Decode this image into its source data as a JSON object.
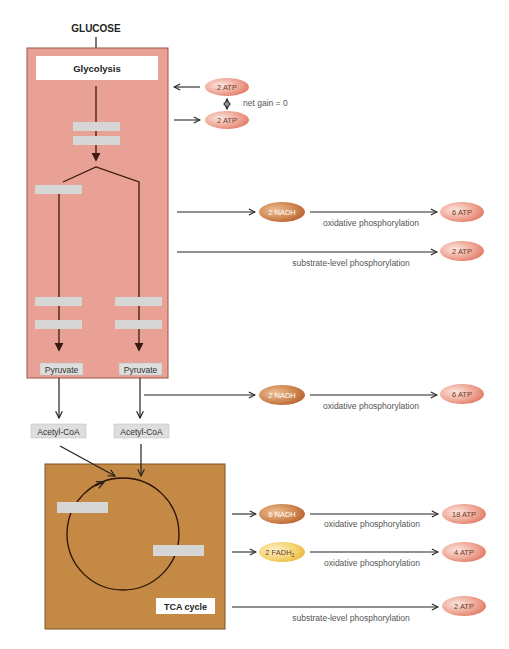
{
  "diagram": {
    "title": "GLUCOSE",
    "glycolysis_label": "Glycolysis",
    "tca_label": "TCA cycle",
    "pyruvate_left": "Pyruvate",
    "pyruvate_right": "Pyruvate",
    "acetyl_left": "Acetyl-CoA",
    "acetyl_right": "Acetyl-CoA",
    "net_gain": "net gain = 0",
    "nodes": {
      "atp_in": "2 ATP",
      "atp_out": "2 ATP",
      "nadh_glycolysis": "2 NADH",
      "atp_from_nadh_glycolysis": "6 ATP",
      "atp_substrate_glycolysis": "2 ATP",
      "nadh_pyruvate": "2 NADH",
      "atp_from_nadh_pyruvate": "6 ATP",
      "nadh_tca": "6 NADH",
      "atp_from_nadh_tca": "18 ATP",
      "fadh2_tca": "2 FADH",
      "fadh2_sub": "2",
      "atp_from_fadh2_tca": "4 ATP",
      "atp_substrate_tca": "2 ATP"
    },
    "process_labels": {
      "oxphos_1": "oxidative phosphorylation",
      "substrate_1": "substrate-level phosphorylation",
      "oxphos_2": "oxidative phosphorylation",
      "oxphos_3": "oxidative phosphorylation",
      "oxphos_4": "oxidative phosphorylation",
      "substrate_2": "substrate-level phosphorylation"
    },
    "colors": {
      "glycolysis_box": "#e9a195",
      "tca_box": "#c48a45",
      "atp_pill": "#e98a78",
      "nadh_pill": "#c46a35",
      "fadh2_pill": "#f0c040",
      "blank_box": "#d6d6d6"
    }
  }
}
